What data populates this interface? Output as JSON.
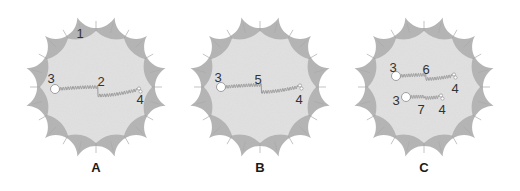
{
  "figure": {
    "background": "#ffffff",
    "colors": {
      "rim": "#b4b4b4",
      "rim_dark": "#a2a2a2",
      "inner": "#e2e2e2",
      "chain": "#9a9a9a",
      "bead": "#ffffff",
      "bead_stroke": "#8a8a8a",
      "text": "#333333"
    },
    "panels": [
      {
        "id": "A",
        "label": "A",
        "center": [
          96,
          87
        ],
        "outer_radius": 72,
        "inner_radius": 56,
        "lobes": 12,
        "rim_label": {
          "text": "1",
          "x": 80,
          "y": 34
        },
        "chains": [
          {
            "start": [
              55,
              89
            ],
            "end": [
              139,
              90
            ],
            "start_label": {
              "text": "3",
              "x": 51,
              "y": 79
            },
            "mid_label": {
              "text": "2",
              "x": 101,
              "y": 82
            },
            "end_label": {
              "text": "4",
              "x": 140,
              "y": 100
            },
            "sag": 6
          }
        ]
      },
      {
        "id": "B",
        "label": "B",
        "center": [
          260,
          87
        ],
        "outer_radius": 72,
        "inner_radius": 56,
        "lobes": 12,
        "rim_label": null,
        "chains": [
          {
            "start": [
              221,
              87
            ],
            "end": [
              300,
              87
            ],
            "start_label": {
              "text": "3",
              "x": 218,
              "y": 78
            },
            "mid_label": {
              "text": "5",
              "x": 258,
              "y": 80
            },
            "end_label": {
              "text": "4",
              "x": 299,
              "y": 100
            },
            "sag": 5
          }
        ]
      },
      {
        "id": "C",
        "label": "C",
        "center": [
          424,
          87
        ],
        "outer_radius": 72,
        "inner_radius": 56,
        "lobes": 12,
        "rim_label": null,
        "chains": [
          {
            "start": [
              396,
              76
            ],
            "end": [
              454,
              76
            ],
            "start_label": {
              "text": "3",
              "x": 393,
              "y": 68
            },
            "mid_label": {
              "text": "6",
              "x": 426,
              "y": 70
            },
            "end_label": {
              "text": "4",
              "x": 455,
              "y": 89
            },
            "sag": 3
          },
          {
            "start": [
              406,
              97
            ],
            "end": [
              441,
              97
            ],
            "start_label": {
              "text": "3",
              "x": 396,
              "y": 101
            },
            "mid_label": {
              "text": "7",
              "x": 421,
              "y": 110
            },
            "end_label": {
              "text": "4",
              "x": 442,
              "y": 110
            },
            "sag": 1
          }
        ]
      }
    ],
    "panel_label_y": 172
  }
}
